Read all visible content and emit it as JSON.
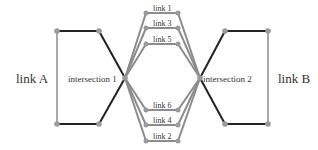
{
  "diagram": {
    "colors": {
      "black_edge": "#222222",
      "gray_edge": "#8c8c8c",
      "node": "#9a9a9a"
    },
    "labels": {
      "link_a": "link A",
      "link_b": "link B",
      "intersection_1": "intersection 1",
      "intersection_2": "intersection 2"
    },
    "links": [
      {
        "id": "link1",
        "label": "link 1"
      },
      {
        "id": "link3",
        "label": "link 3"
      },
      {
        "id": "link5",
        "label": "link 5"
      },
      {
        "id": "link6",
        "label": "link 6"
      },
      {
        "id": "link4",
        "label": "link 4"
      },
      {
        "id": "link2",
        "label": "link 2"
      }
    ]
  }
}
